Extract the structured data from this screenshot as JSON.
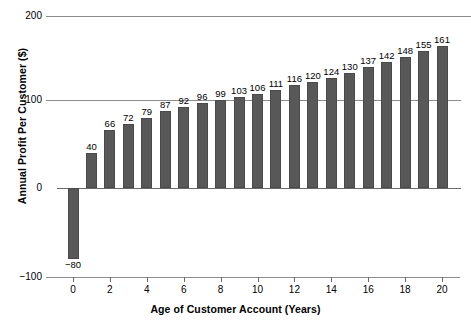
{
  "chart_data": {
    "type": "bar",
    "title": "",
    "xlabel": "Age of Customer Account (Years)",
    "ylabel": "Annual Profit Per Customer ($)",
    "categories": [
      0,
      1,
      2,
      3,
      4,
      5,
      6,
      7,
      8,
      9,
      10,
      11,
      12,
      13,
      14,
      15,
      16,
      17,
      18,
      19,
      20
    ],
    "values": [
      -80,
      40,
      66,
      72,
      79,
      87,
      92,
      96,
      99,
      103,
      106,
      111,
      116,
      120,
      124,
      130,
      137,
      142,
      148,
      155,
      161
    ],
    "value_labels": [
      "−80",
      "40",
      "66",
      "72",
      "79",
      "87",
      "92",
      "96",
      "99",
      "103",
      "106",
      "111",
      "116",
      "120",
      "124",
      "130",
      "137",
      "142",
      "148",
      "155",
      "161"
    ],
    "series": [
      {
        "name": "Annual Profit Per Customer",
        "values": [
          -80,
          40,
          66,
          72,
          79,
          87,
          92,
          96,
          99,
          103,
          106,
          111,
          116,
          120,
          124,
          130,
          137,
          142,
          148,
          155,
          161
        ]
      }
    ],
    "ylim": [
      -100,
      200
    ],
    "y_ticks": [
      -100,
      0,
      100,
      200
    ],
    "y_tick_labels": [
      "−100",
      "0",
      "100",
      "200"
    ],
    "xlim": [
      -1,
      21
    ],
    "x_ticks": [
      0,
      2,
      4,
      6,
      8,
      10,
      12,
      14,
      16,
      18,
      20
    ],
    "x_tick_labels": [
      "0",
      "2",
      "4",
      "6",
      "8",
      "10",
      "12",
      "14",
      "16",
      "18",
      "20"
    ],
    "grid": "horizontal",
    "legend": "none",
    "bar_color": "#585858",
    "gridline_color": "#8c8c8c",
    "background_color": "#ffffff",
    "data_labels_shown": true
  }
}
